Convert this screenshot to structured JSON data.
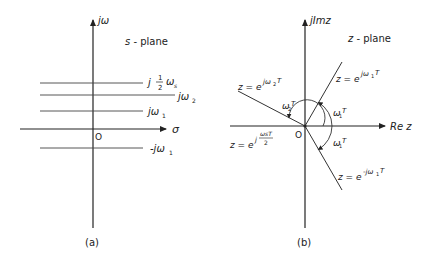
{
  "figure": {
    "left_panel": {
      "caption": "(a)",
      "plane_label": "s - plane",
      "y_axis_label": "jω",
      "x_axis_label": "σ",
      "origin_label": "O",
      "lines": [
        {
          "label": "j ½ ωs",
          "main": "j",
          "frac_num": "1",
          "frac_den": "2",
          "sym": "ω",
          "sub": "s"
        },
        {
          "label": "jω2",
          "main": "jω",
          "sub": "2"
        },
        {
          "label": "jω1",
          "main": "jω",
          "sub": "1"
        },
        {
          "label": "-jω1",
          "main": "-jω",
          "sub": "1"
        }
      ]
    },
    "right_panel": {
      "caption": "(b)",
      "plane_label": "z - plane",
      "y_axis_label": "jImz",
      "x_axis_label": "Re z",
      "origin_label": "O",
      "rays": [
        {
          "label": "z = e^{jω1T}",
          "base": "z = e",
          "exp": "jω",
          "exp_sub": "1",
          "exp_tail": "T"
        },
        {
          "label": "z = e^{jω2T}",
          "base": "z = e",
          "exp": "jω",
          "exp_sub": "2",
          "exp_tail": "T"
        },
        {
          "label": "z = e^{-jω1T}",
          "base": "z = e",
          "exp": "-jω",
          "exp_sub": "1",
          "exp_tail": "T"
        },
        {
          "label": "z = e^{j ωsT/2}",
          "base": "z = e",
          "exp": "j",
          "frac_num": "ωsT",
          "frac_den": "2"
        }
      ],
      "angles": [
        {
          "label": "ω1T",
          "sym": "ω",
          "sub": "1",
          "tail": "T"
        },
        {
          "label": "ω2T",
          "sym": "ω",
          "sub": "2",
          "tail": "T"
        },
        {
          "label": "ω1T",
          "sym": "ω",
          "sub": "1",
          "tail": "T"
        }
      ]
    }
  }
}
